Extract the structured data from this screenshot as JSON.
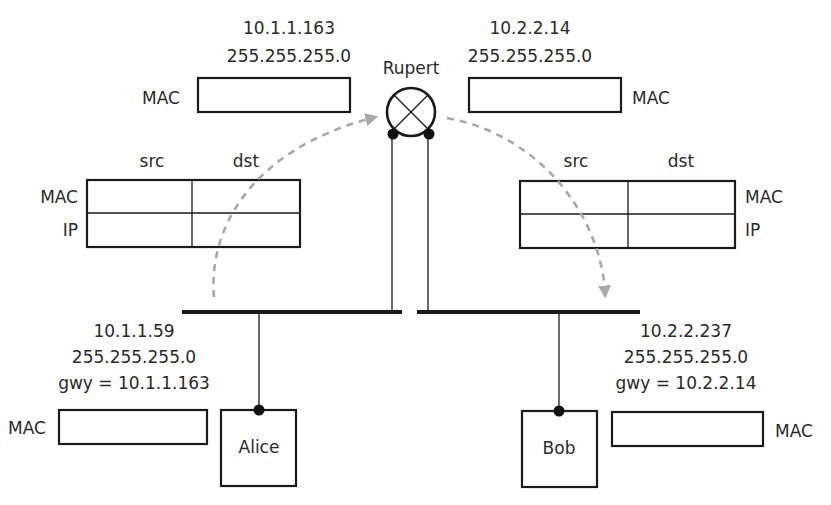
{
  "diagram": {
    "type": "network-routing",
    "router": {
      "name": "Rupert",
      "left_interface": {
        "ip": "10.1.1.163",
        "mask": "255.255.255.0",
        "mac_label": "MAC"
      },
      "right_interface": {
        "ip": "10.2.2.14",
        "mask": "255.255.255.0",
        "mac_label": "MAC"
      }
    },
    "hosts": [
      {
        "name": "Alice",
        "ip": "10.1.1.59",
        "mask": "255.255.255.0",
        "gateway": "gwy = 10.1.1.163",
        "mac_label": "MAC"
      },
      {
        "name": "Bob",
        "ip": "10.2.2.237",
        "mask": "255.255.255.0",
        "gateway": "gwy = 10.2.2.14",
        "mac_label": "MAC"
      }
    ],
    "frame_tables": [
      {
        "col_headers": [
          "src",
          "dst"
        ],
        "row_headers": [
          "MAC",
          "IP"
        ],
        "side": "left"
      },
      {
        "col_headers": [
          "src",
          "dst"
        ],
        "row_headers": [
          "MAC",
          "IP"
        ],
        "side": "right"
      }
    ],
    "colors": {
      "line": "#1a1a1a",
      "arrow": "#a8a8a8",
      "text": "#2a2a2a"
    }
  }
}
